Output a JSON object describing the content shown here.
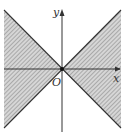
{
  "diagram": {
    "type": "inequality-region",
    "axes": {
      "x_label": "x",
      "y_label": "y",
      "origin_label": "O"
    },
    "lines": [
      {
        "name": "y = x",
        "from": [
          4,
          128
        ],
        "to": [
          121,
          10
        ]
      },
      {
        "name": "y = -x",
        "from": [
          4,
          10
        ],
        "to": [
          121,
          128
        ]
      }
    ],
    "shaded_regions": [
      "left wedge (between lines, x < 0)",
      "right wedge (between lines, x > 0)"
    ],
    "colors": {
      "line": "#333333",
      "hatch": "#888888",
      "fill": "#c8c8c8"
    }
  }
}
